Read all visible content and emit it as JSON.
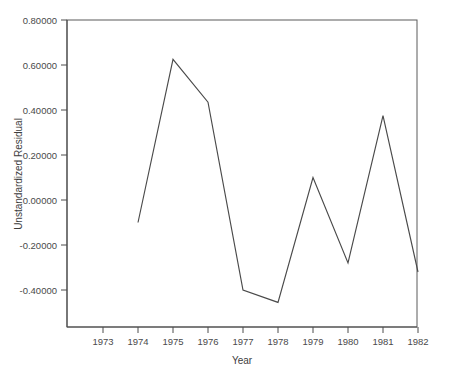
{
  "chart_data": {
    "type": "line",
    "title": "",
    "xlabel": "Year",
    "ylabel": "Unstandardized Residual",
    "x": [
      1974,
      1975,
      1976,
      1977,
      1978,
      1979,
      1980,
      1981,
      1982
    ],
    "values": [
      -0.1,
      0.625,
      0.435,
      -0.4,
      -0.455,
      0.1,
      -0.28,
      0.375,
      -0.32
    ],
    "series": [
      {
        "name": "Unstandardized Residual",
        "values": [
          -0.1,
          0.625,
          0.435,
          -0.4,
          -0.455,
          0.1,
          -0.28,
          0.375,
          -0.32
        ]
      }
    ],
    "xticks": [
      1973,
      1974,
      1975,
      1976,
      1977,
      1978,
      1979,
      1980,
      1981,
      1982
    ],
    "xtick_labels": [
      "1973",
      "1974",
      "1975",
      "1976",
      "1977",
      "1978",
      "1979",
      "1980",
      "1981",
      "1982"
    ],
    "yticks": [
      0.8,
      0.6,
      0.4,
      0.2,
      0.0,
      -0.2,
      -0.4
    ],
    "ytick_labels": [
      "0.80000",
      "0.60000",
      "0.40000",
      "0.20000",
      "0.00000",
      "-0.20000",
      "-0.40000"
    ],
    "xlim": [
      1972.5,
      1982.5
    ],
    "ylim": [
      -0.52,
      0.84
    ],
    "grid": false,
    "legend": "none",
    "line_color": "#4a4a4a"
  },
  "axes": {
    "y_axis_title": "Unstandardized Residual",
    "x_axis_title": "Year"
  }
}
